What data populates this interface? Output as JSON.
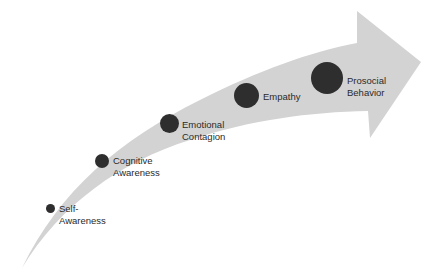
{
  "diagram": {
    "type": "curved-progression-arrow",
    "arrow_color": "#d3d3d3",
    "dot_color": "#2e2e2e",
    "text_color": "#2a2a2a",
    "stages": [
      {
        "label": "Self-\nAwareness",
        "order": 1,
        "size": "smallest"
      },
      {
        "label": "Cognitive\nAwareness",
        "order": 2,
        "size": "small"
      },
      {
        "label": "Emotional\nContagion",
        "order": 3,
        "size": "medium"
      },
      {
        "label": "Empathy",
        "order": 4,
        "size": "large"
      },
      {
        "label": "Prosocial\nBehavior",
        "order": 5,
        "size": "largest"
      }
    ]
  }
}
